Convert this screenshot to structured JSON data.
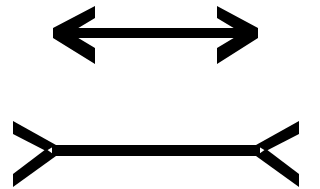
{
  "diagram": {
    "title": "Müller-Lyer illusion",
    "stroke_color": "#000000",
    "background": "#ffffff",
    "figures": [
      {
        "name": "arrow-inward-heads",
        "description": "Line with arrowheads pointing outward (fins closed)",
        "shaft": {
          "x1": 74,
          "x2": 240,
          "y": 33,
          "thickness": 10
        },
        "left_head": {
          "tip": [
            54,
            33
          ],
          "arm_top": [
            95,
            9
          ],
          "arm_bottom": [
            95,
            60
          ]
        },
        "right_head": {
          "tip": [
            257,
            33
          ],
          "arm_top": [
            217,
            9
          ],
          "arm_bottom": [
            217,
            60
          ]
        }
      },
      {
        "name": "arrow-outward-fins",
        "description": "Line with fins pointing outward (fins open)",
        "shaft": {
          "x1": 54,
          "x2": 258,
          "y": 150,
          "thickness": 11
        },
        "left_fin": {
          "vertex": [
            54,
            150
          ],
          "arm_top": [
            14,
            125
          ],
          "arm_bottom": [
            14,
            178
          ]
        },
        "right_fin": {
          "vertex": [
            258,
            150
          ],
          "arm_top": [
            298,
            125
          ],
          "arm_bottom": [
            298,
            178
          ]
        }
      }
    ]
  }
}
